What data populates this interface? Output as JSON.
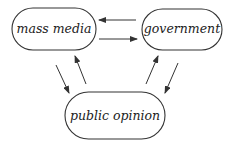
{
  "diagram": {
    "type": "flow",
    "nodes": [
      {
        "id": "mass_media",
        "label": "mass media"
      },
      {
        "id": "government",
        "label": "government"
      },
      {
        "id": "public_opinion",
        "label": "public opinion"
      }
    ],
    "edges": [
      {
        "from": "government",
        "to": "mass_media"
      },
      {
        "from": "mass_media",
        "to": "government"
      },
      {
        "from": "mass_media",
        "to": "public_opinion"
      },
      {
        "from": "public_opinion",
        "to": "mass_media"
      },
      {
        "from": "public_opinion",
        "to": "government"
      },
      {
        "from": "government",
        "to": "public_opinion"
      }
    ],
    "colors": {
      "stroke": "#333333",
      "text": "#222222",
      "background": "#ffffff"
    }
  }
}
